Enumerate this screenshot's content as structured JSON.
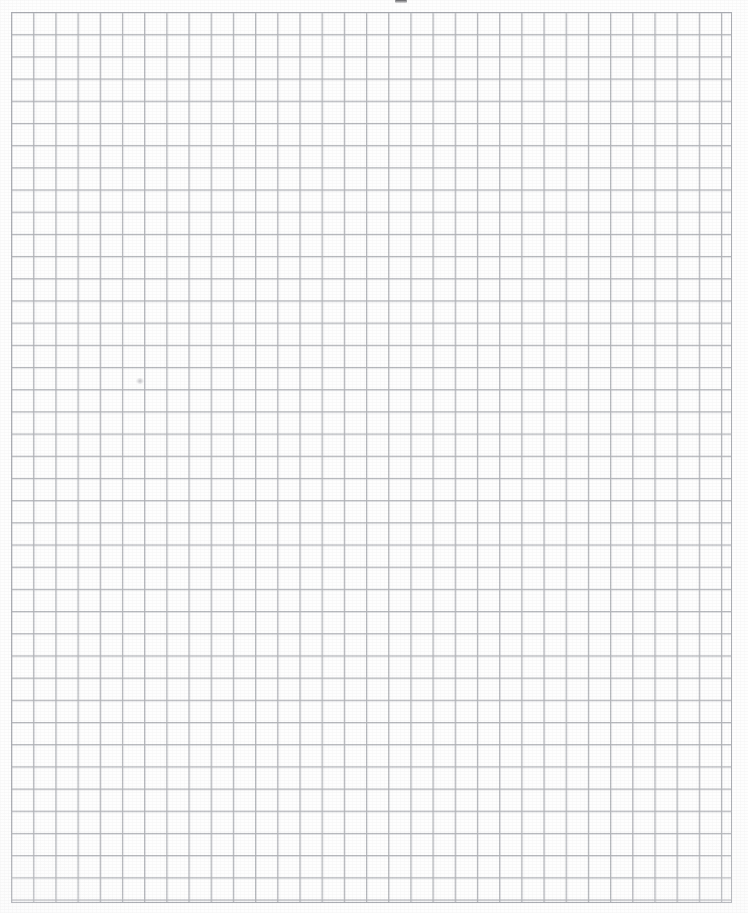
{
  "document": {
    "kind": "grid-paper-scan",
    "title": "Blank Graph Paper Sheet",
    "description": "Scanned blank sheet of square-ruled graph paper with no writing.",
    "page_width": 748,
    "page_height": 913,
    "background_color": "#fefefe"
  },
  "grid": {
    "label": "Square ruled grid",
    "origin_x": 11,
    "origin_y": 12,
    "right_edge": 732,
    "bottom_edge": 903,
    "width": 721,
    "height": 891,
    "cell_size": 22.2,
    "columns": 33,
    "rows": 40,
    "line_color": "#b0b2b7",
    "line_width": 1,
    "frame_color": "#abadb3"
  },
  "margins": {
    "left": 11,
    "top": 12,
    "right": 16,
    "bottom": 10
  },
  "artifacts": [
    {
      "name": "top-edge-scan-mark",
      "x": 395,
      "y": 0,
      "width": 12,
      "height": 3
    },
    {
      "name": "pencil-smudge",
      "x": 136,
      "y": 378,
      "width": 8,
      "height": 6
    }
  ],
  "content": {
    "writing": "",
    "notes": ""
  }
}
